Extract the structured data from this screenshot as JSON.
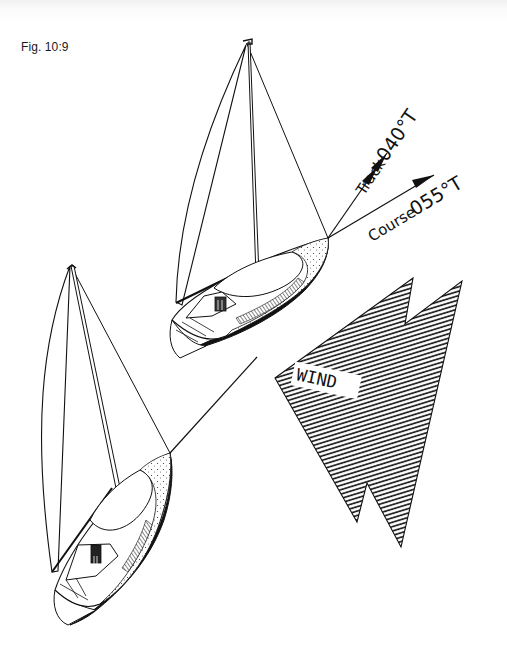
{
  "figure": {
    "label": "Fig. 10:9"
  },
  "annotations": {
    "track": {
      "word": "Track",
      "bearing": "040°T",
      "arrowheads": 2
    },
    "course": {
      "word": "Course",
      "bearing": "055°T",
      "arrowheads": 1
    },
    "wind": {
      "label": "WIND"
    }
  },
  "elements": {
    "upper_boat": "yacht-upper",
    "lower_boat": "yacht-lower",
    "connecting_line": "track-line-between-positions",
    "wind_arrow": "hatched-zigzag-wind-arrow"
  },
  "colors": {
    "ink": "#111111",
    "paper": "#ffffff",
    "top_shade": "#f1f1f1"
  }
}
